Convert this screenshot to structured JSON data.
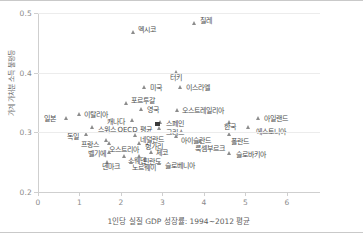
{
  "chart_data": {
    "type": "scatter",
    "title": "",
    "xlabel": "1인당 실질 GDP 성장률: 1994~2012 평균",
    "ylabel": "가계 가처분 소득 불평등",
    "xlim": [
      0,
      6.8
    ],
    "ylim": [
      0.2,
      0.5
    ],
    "xticks": [
      0,
      1,
      2,
      3,
      4,
      5,
      6
    ],
    "xtick_labels": [
      "0",
      "1",
      "2",
      "3",
      "4",
      "5",
      "6"
    ],
    "yticks": [
      0.2,
      0.3,
      0.4,
      0.5
    ],
    "ytick_labels": [
      "0.2",
      "0.3",
      "0.4",
      "0.5"
    ],
    "grid": true,
    "legend": "none",
    "marker_color": "#8c8c8c",
    "highlight_color": "#3a3a3a",
    "points": [
      {
        "label": "칠레",
        "x": 3.78,
        "y": 0.48,
        "lx": 5,
        "ly": -4,
        "marker": "triangle"
      },
      {
        "label": "멕시코",
        "x": 2.3,
        "y": 0.465,
        "lx": 5,
        "ly": -4,
        "marker": "triangle"
      },
      {
        "label": "터키",
        "x": 3.33,
        "y": 0.398,
        "lx": -6,
        "ly": 4,
        "marker": "triangle"
      },
      {
        "label": "미국",
        "x": 2.58,
        "y": 0.373,
        "lx": 5,
        "ly": -1,
        "marker": "triangle"
      },
      {
        "label": "이스라엘",
        "x": 3.44,
        "y": 0.372,
        "lx": 5,
        "ly": -1,
        "marker": "triangle"
      },
      {
        "label": "포르투갈",
        "x": 2.13,
        "y": 0.346,
        "lx": 5,
        "ly": -4,
        "marker": "triangle"
      },
      {
        "label": "영국",
        "x": 2.5,
        "y": 0.336,
        "lx": 5,
        "ly": -1,
        "marker": "triangle"
      },
      {
        "label": "오스트레일리아",
        "x": 3.36,
        "y": 0.334,
        "lx": 5,
        "ly": -1,
        "marker": "triangle"
      },
      {
        "label": "이탈리아",
        "x": 1.0,
        "y": 0.327,
        "lx": 5,
        "ly": -1,
        "marker": "triangle"
      },
      {
        "label": "일본",
        "x": 0.68,
        "y": 0.321,
        "lx": -22,
        "ly": -1,
        "marker": "triangle"
      },
      {
        "label": "아일랜드",
        "x": 5.33,
        "y": 0.321,
        "lx": 5,
        "ly": -1,
        "marker": "triangle"
      },
      {
        "label": "한국",
        "x": 4.63,
        "y": 0.314,
        "lx": -6,
        "ly": 3,
        "marker": "triangle"
      },
      {
        "label": "캐나다",
        "x": 2.28,
        "y": 0.317,
        "lx": -26,
        "ly": 0,
        "marker": "triangle"
      },
      {
        "label": "스페인",
        "x": 2.95,
        "y": 0.313,
        "lx": 6,
        "ly": -1,
        "marker": "triangle"
      },
      {
        "label": "에스토니아",
        "x": 5.07,
        "y": 0.305,
        "lx": 8,
        "ly": 3,
        "marker": "triangle"
      },
      {
        "label": "스위스",
        "x": 1.32,
        "y": 0.306,
        "lx": 5,
        "ly": 1,
        "marker": "triangle"
      },
      {
        "label": "OECD 평균",
        "x": 2.88,
        "y": 0.311,
        "lx": -40,
        "ly": 4,
        "marker": "square"
      },
      {
        "label": "그리스",
        "x": 2.93,
        "y": 0.303,
        "lx": 6,
        "ly": 2,
        "marker": "triangle"
      },
      {
        "label": "독일",
        "x": 1.18,
        "y": 0.293,
        "lx": -20,
        "ly": 0,
        "marker": "triangle"
      },
      {
        "label": "네덜란드",
        "x": 2.35,
        "y": 0.292,
        "lx": 5,
        "ly": 3,
        "marker": "triangle"
      },
      {
        "label": "아이슬란드",
        "x": 3.33,
        "y": 0.29,
        "lx": 5,
        "ly": 3,
        "marker": "triangle"
      },
      {
        "label": "폴란드",
        "x": 4.63,
        "y": 0.293,
        "lx": 1,
        "ly": 5,
        "marker": "triangle"
      },
      {
        "label": "프랑스",
        "x": 1.65,
        "y": 0.283,
        "lx": -25,
        "ly": 3,
        "marker": "triangle"
      },
      {
        "label": "룩셈부르크",
        "x": 3.93,
        "y": 0.281,
        "lx": -6,
        "ly": 5,
        "marker": "triangle"
      },
      {
        "label": "오스트리아",
        "x": 1.72,
        "y": 0.278,
        "lx": 0,
        "ly": 5,
        "marker": "triangle"
      },
      {
        "label": "헝가리",
        "x": 2.46,
        "y": 0.278,
        "lx": 5,
        "ly": 2,
        "marker": "triangle"
      },
      {
        "label": "벨기에",
        "x": 1.73,
        "y": 0.264,
        "lx": -22,
        "ly": 0,
        "marker": "triangle"
      },
      {
        "label": "체코",
        "x": 2.73,
        "y": 0.264,
        "lx": 5,
        "ly": -1,
        "marker": "triangle"
      },
      {
        "label": "슬로바키아",
        "x": 4.63,
        "y": 0.262,
        "lx": 6,
        "ly": 0,
        "marker": "triangle"
      },
      {
        "label": "스웨덴",
        "x": 2.1,
        "y": 0.257,
        "lx": 3,
        "ly": 3,
        "marker": "triangle"
      },
      {
        "label": "핀란드",
        "x": 2.45,
        "y": 0.256,
        "lx": 3,
        "ly": 3,
        "marker": "triangle"
      },
      {
        "label": "덴마크",
        "x": 1.67,
        "y": 0.247,
        "lx": -5,
        "ly": 3,
        "marker": "triangle"
      },
      {
        "label": "노르웨이",
        "x": 2.25,
        "y": 0.247,
        "lx": 1,
        "ly": 4,
        "marker": "triangle"
      },
      {
        "label": "슬로베니아",
        "x": 2.92,
        "y": 0.245,
        "lx": 6,
        "ly": 1,
        "marker": "triangle"
      }
    ]
  }
}
